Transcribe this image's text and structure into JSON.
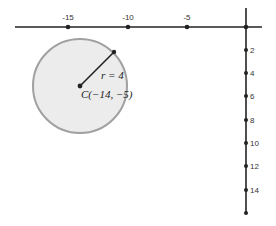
{
  "diagram": {
    "type": "coordinate-plane-circle",
    "x_axis": {
      "tick_labels": [
        "-15",
        "-10",
        "-5"
      ],
      "tick_values": [
        -15,
        -10,
        -5
      ]
    },
    "y_axis": {
      "tick_labels": [
        "2",
        "4",
        "6",
        "8",
        "10",
        "12",
        "14"
      ],
      "tick_values": [
        2,
        4,
        6,
        8,
        10,
        12,
        14
      ],
      "orientation": "positive-down"
    },
    "circle": {
      "center_label": "C(−14, −5)",
      "radius_label": "r = 4",
      "center": [
        -14,
        -5
      ],
      "radius": 4,
      "fill_color": "#ececec",
      "stroke_color": "#999999"
    },
    "colors": {
      "axis": "#222222",
      "radius_line": "#222222"
    }
  }
}
